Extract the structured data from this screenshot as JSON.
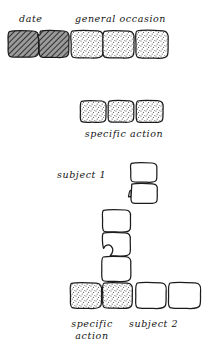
{
  "diagram": {
    "title": "",
    "type": "hand-drawn chunk hierarchy diagram",
    "fills": {
      "hatched": "#6b6b6b",
      "stippled": "#e8e8e8",
      "white": "#ffffff",
      "outline": "#1b1b1b"
    },
    "labels": {
      "date": "date",
      "general_occasion": "general occasion",
      "specific_action": "specific action",
      "subject_1": "subject 1",
      "specific_action_line1": "specific",
      "specific_action_line2": "action",
      "subject_2": "subject 2"
    },
    "rows": [
      {
        "name": "row-1",
        "y": 30,
        "boxes": [
          {
            "fill": "hatch",
            "x": 8,
            "w": 31
          },
          {
            "fill": "hatch",
            "x": 38,
            "w": 31
          },
          {
            "fill": "stipple",
            "x": 70,
            "w": 33
          },
          {
            "fill": "stipple",
            "x": 102,
            "w": 32
          },
          {
            "fill": "stipple",
            "x": 135,
            "w": 33
          }
        ]
      },
      {
        "name": "row-2",
        "y": 100,
        "boxes": [
          {
            "fill": "stipple",
            "x": 80,
            "w": 29
          },
          {
            "fill": "stipple",
            "x": 108,
            "w": 29
          },
          {
            "fill": "stipple",
            "x": 136,
            "w": 30
          }
        ]
      },
      {
        "name": "column-subject-1",
        "x": 130,
        "boxes": [
          {
            "fill": "white",
            "y": 162,
            "h": 22
          },
          {
            "fill": "white",
            "y": 183,
            "h": 22
          }
        ]
      },
      {
        "name": "column-middle",
        "x": 102,
        "boxes": [
          {
            "fill": "white",
            "y": 209,
            "h": 24
          },
          {
            "fill": "white",
            "y": 232,
            "h": 25
          },
          {
            "fill": "white",
            "y": 256,
            "h": 26
          }
        ]
      },
      {
        "name": "row-bottom",
        "y": 282,
        "boxes": [
          {
            "fill": "stipple",
            "x": 70,
            "w": 35
          },
          {
            "fill": "stipple",
            "x": 104,
            "w": 33
          },
          {
            "fill": "white",
            "x": 136,
            "w": 34
          },
          {
            "fill": "white",
            "x": 169,
            "w": 36
          }
        ]
      }
    ]
  }
}
